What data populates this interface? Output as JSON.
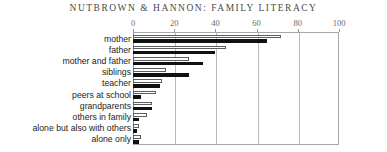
{
  "running_head": "NUTBROWN & HANNON: FAMILY LITERACY",
  "colors": {
    "open_bar_fill": "#ffffff",
    "open_bar_stroke": "#5d5d5d",
    "solid_bar_fill": "#111111",
    "gridline": "#b9b9b9",
    "axis": "#8a8a8a",
    "label_text": "#1c1c1c",
    "tick_text": "#6a6a6a",
    "running_head_text": "#4a4a4a"
  },
  "chart_data": {
    "type": "bar",
    "orientation": "horizontal",
    "title": "",
    "subtitle": "",
    "xlabel": "",
    "ylabel": "",
    "xlim": [
      0,
      100
    ],
    "xticks": [
      0,
      20,
      40,
      60,
      80,
      100
    ],
    "xtick_labels": [
      "0",
      "20",
      "40",
      "60",
      "80",
      "100"
    ],
    "grid": true,
    "grid_axis": "x",
    "legend": false,
    "legend_position": "none",
    "categories": [
      "mother",
      "father",
      "mother and father",
      "siblings",
      "teacher",
      "peers at school",
      "grandparents",
      "others in family",
      "alone but also with others",
      "alone only"
    ],
    "series": [
      {
        "name": "open",
        "style": "hollow",
        "values": [
          72,
          45,
          27,
          16,
          14,
          11,
          9,
          7,
          3,
          4
        ]
      },
      {
        "name": "solid",
        "style": "filled",
        "values": [
          65,
          40,
          34,
          27,
          13,
          4,
          9,
          3,
          2,
          3
        ]
      }
    ]
  }
}
